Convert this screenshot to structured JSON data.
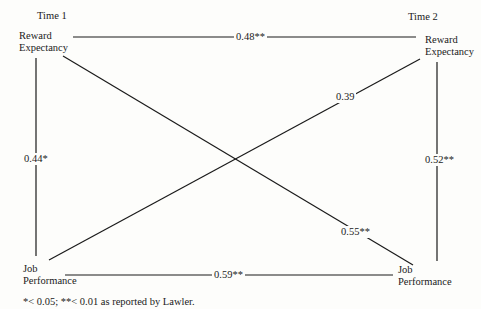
{
  "diagram": {
    "type": "cross-lagged-correlation",
    "time_labels": {
      "t1": "Time 1",
      "t2": "Time 2"
    },
    "nodes": {
      "re1": {
        "line1": "Reward",
        "line2": "Expectancy"
      },
      "re2": {
        "line1": "Reward",
        "line2": "Expectancy"
      },
      "jp1": {
        "line1": "Job",
        "line2": "Performance"
      },
      "jp2": {
        "line1": "Job",
        "line2": "Performance"
      }
    },
    "edges": [
      {
        "id": "re1-re2",
        "from": "re1",
        "to": "re2",
        "label": "0.48**",
        "r": 0.48,
        "sig": "p<0.01"
      },
      {
        "id": "re1-jp1",
        "from": "re1",
        "to": "jp1",
        "label": "0.44*",
        "r": 0.44,
        "sig": "p<0.05"
      },
      {
        "id": "re2-jp2",
        "from": "re2",
        "to": "jp2",
        "label": "0.52**",
        "r": 0.52,
        "sig": "p<0.01"
      },
      {
        "id": "jp1-jp2",
        "from": "jp1",
        "to": "jp2",
        "label": "0.59**",
        "r": 0.59,
        "sig": "p<0.01"
      },
      {
        "id": "jp1-re2",
        "from": "jp1",
        "to": "re2",
        "label": "0.39",
        "r": 0.39,
        "sig": "n.s."
      },
      {
        "id": "re1-jp2",
        "from": "re1",
        "to": "jp2",
        "label": "0.55**",
        "r": 0.55,
        "sig": "p<0.01"
      }
    ],
    "footnote": "*< 0.05; **< 0.01  as reported by Lawler."
  }
}
